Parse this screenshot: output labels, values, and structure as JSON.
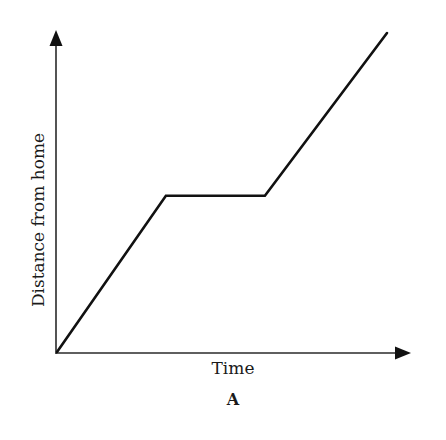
{
  "chart_data": {
    "type": "line",
    "title": "",
    "caption": "A",
    "xlabel": "Time",
    "ylabel": "Distance from home",
    "grid": false,
    "legend": null,
    "axis_ticks": false,
    "series": [
      {
        "name": "Distance from home",
        "points_relative": [
          {
            "x": 0.0,
            "y": 0.0
          },
          {
            "x": 0.33,
            "y": 0.49
          },
          {
            "x": 0.63,
            "y": 0.49
          },
          {
            "x": 1.0,
            "y": 1.0
          }
        ],
        "segments": [
          "increasing",
          "constant",
          "increasing (steeper)"
        ]
      }
    ],
    "xlim": [
      0,
      1
    ],
    "ylim": [
      0,
      1
    ]
  },
  "figure": {
    "xlabel": "Time",
    "ylabel": "Distance from home",
    "caption": "A"
  }
}
